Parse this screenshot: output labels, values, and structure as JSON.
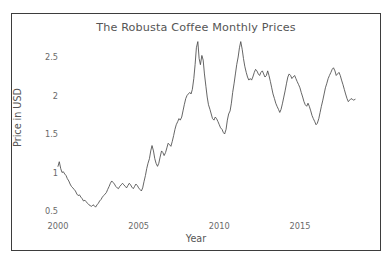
{
  "chart_data": {
    "type": "line",
    "title": "The Robusta Coffee Monthly Prices",
    "xlabel": "Year",
    "ylabel": "Price in USD",
    "grid": false,
    "legend": "none",
    "line_color": "#4a4a4a",
    "xlim": [
      2000.0,
      2018.6
    ],
    "ylim": [
      0.42,
      2.78
    ],
    "xticks": [
      2000,
      2005,
      2010,
      2015
    ],
    "xtick_labels": [
      "2000",
      "2005",
      "2010",
      "2015"
    ],
    "yticks": [
      0.5,
      1,
      1.5,
      2,
      2.5
    ],
    "ytick_labels": [
      "0.5",
      "1",
      "1.5",
      "2",
      "2.5"
    ],
    "series": [
      {
        "name": "Robusta Coffee Monthly Price",
        "x": [
          2000.0,
          2000.08,
          2000.17,
          2000.25,
          2000.33,
          2000.42,
          2000.5,
          2000.58,
          2000.67,
          2000.75,
          2000.83,
          2000.92,
          2001.0,
          2001.08,
          2001.17,
          2001.25,
          2001.33,
          2001.42,
          2001.5,
          2001.58,
          2001.67,
          2001.75,
          2001.83,
          2001.92,
          2002.0,
          2002.08,
          2002.17,
          2002.25,
          2002.33,
          2002.42,
          2002.5,
          2002.58,
          2002.67,
          2002.75,
          2002.83,
          2002.92,
          2003.0,
          2003.08,
          2003.17,
          2003.25,
          2003.33,
          2003.42,
          2003.5,
          2003.58,
          2003.67,
          2003.75,
          2003.83,
          2003.92,
          2004.0,
          2004.08,
          2004.17,
          2004.25,
          2004.33,
          2004.42,
          2004.5,
          2004.58,
          2004.67,
          2004.75,
          2004.83,
          2004.92,
          2005.0,
          2005.08,
          2005.17,
          2005.25,
          2005.33,
          2005.42,
          2005.5,
          2005.58,
          2005.67,
          2005.75,
          2005.83,
          2005.92,
          2006.0,
          2006.08,
          2006.17,
          2006.25,
          2006.33,
          2006.42,
          2006.5,
          2006.58,
          2006.67,
          2006.75,
          2006.83,
          2006.92,
          2007.0,
          2007.08,
          2007.17,
          2007.25,
          2007.33,
          2007.42,
          2007.5,
          2007.58,
          2007.67,
          2007.75,
          2007.83,
          2007.92,
          2008.0,
          2008.08,
          2008.17,
          2008.25,
          2008.33,
          2008.42,
          2008.5,
          2008.58,
          2008.67,
          2008.75,
          2008.83,
          2008.92,
          2009.0,
          2009.08,
          2009.17,
          2009.25,
          2009.33,
          2009.42,
          2009.5,
          2009.58,
          2009.67,
          2009.75,
          2009.83,
          2009.92,
          2010.0,
          2010.08,
          2010.17,
          2010.25,
          2010.33,
          2010.42,
          2010.5,
          2010.58,
          2010.67,
          2010.75,
          2010.83,
          2010.92,
          2011.0,
          2011.08,
          2011.17,
          2011.25,
          2011.33,
          2011.42,
          2011.5,
          2011.58,
          2011.67,
          2011.75,
          2011.83,
          2011.92,
          2012.0,
          2012.08,
          2012.17,
          2012.25,
          2012.33,
          2012.42,
          2012.5,
          2012.58,
          2012.67,
          2012.75,
          2012.83,
          2012.92,
          2013.0,
          2013.08,
          2013.17,
          2013.25,
          2013.33,
          2013.42,
          2013.5,
          2013.58,
          2013.67,
          2013.75,
          2013.83,
          2013.92,
          2014.0,
          2014.08,
          2014.17,
          2014.25,
          2014.33,
          2014.42,
          2014.5,
          2014.58,
          2014.67,
          2014.75,
          2014.83,
          2014.92,
          2015.0,
          2015.08,
          2015.17,
          2015.25,
          2015.33,
          2015.42,
          2015.5,
          2015.58,
          2015.67,
          2015.75,
          2015.83,
          2015.92,
          2016.0,
          2016.08,
          2016.17,
          2016.25,
          2016.33,
          2016.42,
          2016.5,
          2016.58,
          2016.67,
          2016.75,
          2016.83,
          2016.92,
          2017.0,
          2017.08,
          2017.17,
          2017.25,
          2017.33,
          2017.42,
          2017.5,
          2017.58,
          2017.67,
          2017.75,
          2017.83,
          2017.92,
          2018.0,
          2018.08,
          2018.17,
          2018.25,
          2018.33,
          2018.42
        ],
        "y": [
          1.08,
          1.14,
          1.05,
          1.0,
          1.01,
          0.98,
          0.96,
          0.92,
          0.89,
          0.85,
          0.82,
          0.8,
          0.78,
          0.76,
          0.72,
          0.7,
          0.71,
          0.68,
          0.66,
          0.63,
          0.64,
          0.62,
          0.6,
          0.58,
          0.57,
          0.56,
          0.58,
          0.57,
          0.55,
          0.58,
          0.6,
          0.63,
          0.65,
          0.68,
          0.7,
          0.72,
          0.74,
          0.78,
          0.82,
          0.86,
          0.89,
          0.87,
          0.85,
          0.82,
          0.8,
          0.79,
          0.82,
          0.84,
          0.86,
          0.84,
          0.82,
          0.8,
          0.83,
          0.86,
          0.84,
          0.81,
          0.79,
          0.82,
          0.85,
          0.83,
          0.8,
          0.78,
          0.76,
          0.8,
          0.88,
          0.96,
          1.05,
          1.12,
          1.18,
          1.28,
          1.35,
          1.28,
          1.18,
          1.12,
          1.08,
          1.12,
          1.2,
          1.28,
          1.26,
          1.22,
          1.26,
          1.32,
          1.38,
          1.36,
          1.34,
          1.4,
          1.48,
          1.56,
          1.62,
          1.66,
          1.7,
          1.68,
          1.72,
          1.8,
          1.88,
          1.96,
          2.0,
          2.02,
          2.04,
          2.02,
          2.08,
          2.22,
          2.4,
          2.62,
          2.7,
          2.48,
          2.4,
          2.52,
          2.46,
          2.28,
          2.12,
          1.98,
          1.88,
          1.82,
          1.76,
          1.7,
          1.68,
          1.72,
          1.7,
          1.66,
          1.62,
          1.58,
          1.56,
          1.52,
          1.5,
          1.56,
          1.68,
          1.76,
          1.8,
          1.9,
          2.04,
          2.16,
          2.28,
          2.4,
          2.5,
          2.62,
          2.7,
          2.6,
          2.48,
          2.38,
          2.3,
          2.24,
          2.2,
          2.22,
          2.2,
          2.24,
          2.3,
          2.34,
          2.32,
          2.28,
          2.26,
          2.3,
          2.32,
          2.28,
          2.24,
          2.26,
          2.32,
          2.26,
          2.18,
          2.1,
          2.02,
          1.96,
          1.9,
          1.86,
          1.82,
          1.78,
          1.82,
          1.9,
          1.98,
          2.06,
          2.16,
          2.24,
          2.28,
          2.26,
          2.22,
          2.24,
          2.26,
          2.22,
          2.18,
          2.14,
          2.1,
          2.04,
          1.98,
          1.92,
          1.88,
          1.86,
          1.9,
          1.86,
          1.8,
          1.74,
          1.7,
          1.66,
          1.62,
          1.64,
          1.7,
          1.78,
          1.86,
          1.94,
          2.02,
          2.1,
          2.16,
          2.22,
          2.26,
          2.3,
          2.34,
          2.36,
          2.32,
          2.26,
          2.28,
          2.3,
          2.26,
          2.2,
          2.14,
          2.08,
          2.02,
          1.96,
          1.92,
          1.94,
          1.96,
          1.95,
          1.94,
          1.95
        ]
      }
    ]
  },
  "axes": {
    "title": "The Robusta Coffee Monthly Prices",
    "xlabel": "Year",
    "ylabel": "Price in USD"
  }
}
